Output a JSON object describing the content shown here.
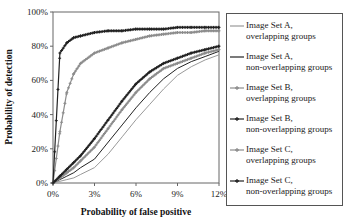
{
  "chart_data": {
    "type": "line",
    "title": "",
    "xlabel": "Probability of false positive",
    "ylabel": "Probability of detection",
    "xlim": [
      0,
      12
    ],
    "ylim": [
      0,
      100
    ],
    "x_ticks": [
      "0%",
      "3%",
      "6%",
      "9%",
      "12%"
    ],
    "y_ticks": [
      "0%",
      "20%",
      "40%",
      "60%",
      "80%",
      "100%"
    ],
    "grid": false,
    "legend_position": "right",
    "x": [
      0,
      0.5,
      1,
      1.5,
      2,
      3,
      4,
      5,
      6,
      7,
      8,
      9,
      10,
      11,
      12
    ],
    "series": [
      {
        "name": "Image Set A, overlapping groups",
        "color": "#9a9a9a",
        "marker": "none",
        "values": [
          0,
          1,
          2,
          3,
          5,
          9,
          17,
          27,
          37,
          46,
          55,
          63,
          68,
          72,
          75
        ]
      },
      {
        "name": "Image Set A, non-overlapping groups",
        "color": "#222222",
        "marker": "none",
        "values": [
          0,
          2,
          4,
          6,
          9,
          14,
          24,
          34,
          44,
          53,
          61,
          67,
          71,
          74,
          77
        ]
      },
      {
        "name": "Image Set B, overlapping groups",
        "color": "#8c8c8c",
        "marker": "plus",
        "values": [
          0,
          30,
          53,
          64,
          70,
          76,
          79,
          82,
          84,
          86,
          87,
          88,
          88,
          89,
          89
        ]
      },
      {
        "name": "Image Set B, non-overlapping groups",
        "color": "#222222",
        "marker": "plus",
        "values": [
          0,
          76,
          82,
          85,
          86,
          88,
          89,
          89,
          90,
          90,
          90,
          91,
          91,
          91,
          91
        ]
      },
      {
        "name": "Image Set C, overlapping groups",
        "color": "#8c8c8c",
        "marker": "plus",
        "values": [
          0,
          3,
          6,
          9,
          13,
          21,
          32,
          43,
          53,
          61,
          67,
          70,
          73,
          76,
          78
        ]
      },
      {
        "name": "Image Set C, non-overlapping groups",
        "color": "#222222",
        "marker": "plus",
        "values": [
          0,
          4,
          8,
          12,
          16,
          26,
          37,
          48,
          58,
          65,
          70,
          73,
          76,
          78,
          80
        ]
      }
    ]
  },
  "legend": {
    "items": [
      {
        "line1": "Image Set A,",
        "line2": "overlapping groups"
      },
      {
        "line1": "Image Set A,",
        "line2": "non-overlapping groups"
      },
      {
        "line1": "Image Set B,",
        "line2": "overlapping groups"
      },
      {
        "line1": "Image Set B,",
        "line2": "non-overlapping groups"
      },
      {
        "line1": "Image Set C,",
        "line2": "overlapping groups"
      },
      {
        "line1": "Image Set C,",
        "line2": "non-overlapping groups"
      }
    ]
  }
}
